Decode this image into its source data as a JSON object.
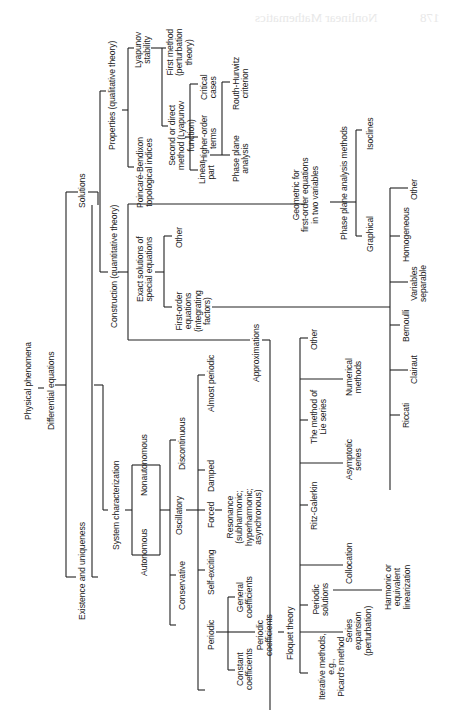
{
  "page": {
    "header_bleedthrough": "Nonlinear Mathematics",
    "page_number_bleedthrough": "178"
  },
  "diagram": {
    "root": {
      "label": "Physical phenomena",
      "child": {
        "label": "Differential equations",
        "children": [
          {
            "label": "Existence and uniqueness"
          },
          {
            "label": "System characterization",
            "children": [
              {
                "label": "Autonomous"
              },
              {
                "label": "Nonautonomous"
              },
              {
                "label": "Conservative"
              },
              {
                "label": "Self-exciting"
              },
              {
                "label": "Oscillatory",
                "children": [
                  {
                    "label": "Forced",
                    "children": [
                      {
                        "label": "Resonance (subharmonic; hyperharmonic; asynchronous)"
                      }
                    ]
                  },
                  {
                    "label": "Damped"
                  }
                ]
              },
              {
                "label": "Discontinuous"
              },
              {
                "label": "Almost periodic"
              },
              {
                "label": "Periodic",
                "children": [
                  {
                    "label": "Constant coefficients"
                  },
                  {
                    "label": "Periodic coefficients",
                    "children": [
                      {
                        "label": "Floquet theory"
                      }
                    ]
                  },
                  {
                    "label": "General coefficients"
                  }
                ]
              }
            ]
          },
          {
            "label": "Solutions",
            "children": [
              {
                "label": "Properties (qualitative theory)",
                "children": [
                  {
                    "label": "Poincaré-Bendixon topological indices"
                  },
                  {
                    "label": "Lyapunov stability",
                    "children": [
                      {
                        "label": "First method (perturbation theory)"
                      },
                      {
                        "label": "Second or direct method (Lyapunov function)",
                        "children": [
                          {
                            "label": "Linear part",
                            "children": [
                              {
                                "label": "Phase plane analysis"
                              },
                              {
                                "label": "Routh-Hurwitz criterion"
                              }
                            ]
                          },
                          {
                            "label": "Higher-order terms"
                          },
                          {
                            "label": "Critical cases"
                          }
                        ]
                      }
                    ]
                  }
                ]
              },
              {
                "label": "Construction (quantitative theory)",
                "children": [
                  {
                    "label": "Exact solutions of special equations",
                    "children": [
                      {
                        "label": "First-order equations (integrating factors)",
                        "children": [
                          {
                            "label": "Riccati"
                          },
                          {
                            "label": "Clairaut"
                          },
                          {
                            "label": "Bernoulli"
                          },
                          {
                            "label": "Variables separable"
                          },
                          {
                            "label": "Homogeneous"
                          },
                          {
                            "label": "Other"
                          }
                        ]
                      },
                      {
                        "label": "Other"
                      }
                    ]
                  },
                  {
                    "label": "Geometric for first-order equations in two variables",
                    "children": [
                      {
                        "label": "Phase plane analysis methods",
                        "children": [
                          {
                            "label": "Graphical"
                          },
                          {
                            "label": "Isoclines"
                          }
                        ]
                      }
                    ]
                  },
                  {
                    "label": "Approximations",
                    "children": [
                      {
                        "label": "Iterative methods, e.g., Picard's method"
                      },
                      {
                        "label": "Series expansion (perturbation)"
                      },
                      {
                        "label": "Periodic solutions",
                        "children": [
                          {
                            "label": "Harmonic or equivalent linearization"
                          }
                        ]
                      },
                      {
                        "label": "Collocation"
                      },
                      {
                        "label": "Ritz-Galerkin"
                      },
                      {
                        "label": "Asymptotic series"
                      },
                      {
                        "label": "The method of Lie series"
                      },
                      {
                        "label": "Numerical methods"
                      },
                      {
                        "label": "Other"
                      }
                    ]
                  }
                ]
              }
            ]
          }
        ]
      }
    }
  },
  "labels": {
    "physical_phenomena": "Physical phenomena",
    "differential_equations": "Differential equations",
    "existence": "Existence and uniqueness",
    "system_char": "System characterization",
    "autonomous": "Autonomous",
    "nonautonomous": "Nonautonomous",
    "conservative": "Conservative",
    "self_exciting": "Self-exciting",
    "oscillatory": "Oscillatory",
    "forced": "Forced",
    "resonance": "Resonance\n(subharmonic;\nhyperharmonic;\nasynchronous)",
    "damped": "Damped",
    "discontinuous": "Discontinuous",
    "almost_periodic": "Almost periodic",
    "periodic": "Periodic",
    "constant_coeff": "Constant\ncoefficients",
    "periodic_coeff": "Periodic\ncoefficients",
    "general_coeff": "General\ncoefficients",
    "floquet": "Floquet theory",
    "solutions": "Solutions",
    "properties": "Properties (qualitative theory)",
    "poincare": "Poincaré-Bendixon\ntopological indices",
    "lyapunov": "Lyapunov\nstability",
    "first_method": "First method\n(perturbation\ntheory)",
    "second_method": "Second or direct\nmethod (Lyapunov\nfunction)",
    "linear_part": "Linear\npart",
    "higher_order": "Higher-order\nterms",
    "critical": "Critical\ncases",
    "phase_plane": "Phase plane\nanalysis",
    "routh": "Routh-Hurwitz\ncriterion",
    "construction": "Construction (quantitative theory)",
    "exact": "Exact solutions of\nspecial equations",
    "exact_other": "Other",
    "first_order": "First-order\nequations\n(integrating\nfactors)",
    "geometric": "Geometric for\nfirst-order equations\nin two variables",
    "phase_methods": "Phase plane analysis methods",
    "graphical": "Graphical",
    "isoclines": "Isoclines",
    "homogeneous": "Homogeneous",
    "fo_other": "Other",
    "variables_sep": "Variables\nseparable",
    "bernoulli": "Bernoulli",
    "clairaut": "Clairaut",
    "riccati": "Riccati",
    "approximations": "Approximations",
    "approx_other": "Other",
    "numerical": "Numerical\nmethods",
    "lie_series": "The method of\nLie series",
    "asymptotic": "Asymptotic\nseries",
    "ritz": "Ritz-Galerkin",
    "collocation": "Collocation",
    "periodic_solutions": "Periodic\nsolutions",
    "harmonic": "Harmonic or\nequivalent\nlinearization",
    "series_expansion": "Series\nexpansion\n(perturbation)",
    "iterative": "Iterative methods,\ne.g.,\nPicard's method"
  }
}
